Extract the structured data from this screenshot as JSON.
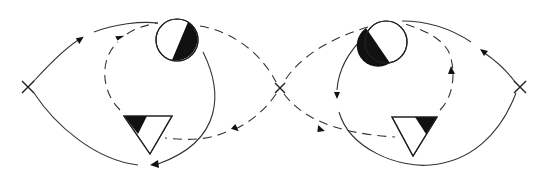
{
  "diagram": {
    "type": "two-lobed flow diagram (figure-eight)",
    "colors": {
      "line": "#333333",
      "fill_dark": "#111111",
      "background": "#ffffff"
    },
    "nodes": [
      {
        "id": "cross-left",
        "shape": "x-mark",
        "x": 28,
        "y": 87
      },
      {
        "id": "cross-center",
        "shape": "x-mark",
        "x": 280,
        "y": 88
      },
      {
        "id": "cross-right",
        "shape": "x-mark",
        "x": 520,
        "y": 87
      },
      {
        "id": "circle-left",
        "shape": "half-filled circle",
        "x": 177,
        "y": 40,
        "r": 21,
        "filled_half": "lower-right"
      },
      {
        "id": "circle-right",
        "shape": "half-filled circle",
        "x": 386,
        "y": 42,
        "r": 21,
        "filled_half": "lower-left"
      },
      {
        "id": "triangle-left",
        "shape": "inverted triangle with filled corner",
        "x": 150,
        "y": 130,
        "filled_corner": "top-left"
      },
      {
        "id": "triangle-right",
        "shape": "inverted triangle with filled corner",
        "x": 415,
        "y": 131,
        "filled_corner": "top-right"
      }
    ],
    "edges": [
      {
        "from": "cross-left",
        "to": "circle-left",
        "style": "solid",
        "arrow": "toward circle"
      },
      {
        "from": "cross-left",
        "to": "triangle-left",
        "style": "solid",
        "arrow": "toward bottom (at triangle base)"
      },
      {
        "from": "circle-left",
        "to": "triangle-left",
        "style": "solid",
        "arrow": "down to bottom-left"
      },
      {
        "from": "triangle-left",
        "to": "circle-left",
        "style": "dashed",
        "arrow": "up toward circle"
      },
      {
        "from": "circle-left",
        "to": "cross-center",
        "style": "dashed",
        "arrow": "none"
      },
      {
        "from": "cross-center",
        "to": "triangle-left",
        "style": "dashed",
        "arrow": "toward triangle"
      },
      {
        "from": "circle-right",
        "to": "cross-center",
        "style": "dashed",
        "arrow": "none"
      },
      {
        "from": "cross-center",
        "to": "triangle-right",
        "style": "dashed",
        "arrow": "toward triangle"
      },
      {
        "from": "circle-right",
        "to": "triangle-right",
        "style": "solid",
        "arrow": "down"
      },
      {
        "from": "triangle-right",
        "to": "circle-right",
        "style": "dashed",
        "arrow": "up"
      },
      {
        "from": "cross-right",
        "to": "circle-right",
        "style": "solid",
        "arrow": "toward circle"
      },
      {
        "from": "triangle-right",
        "to": "cross-right",
        "style": "solid",
        "arrow": "none"
      }
    ],
    "labels": []
  }
}
